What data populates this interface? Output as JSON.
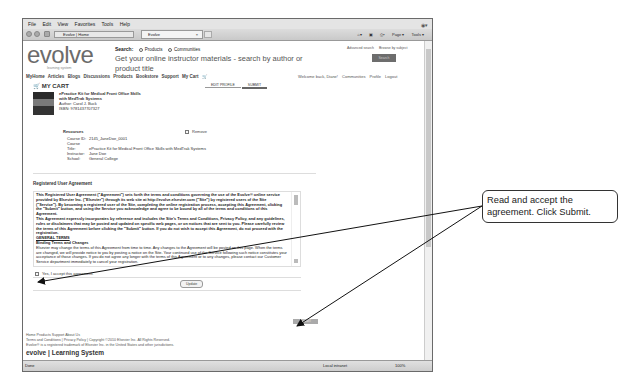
{
  "browser": {
    "menu": [
      "File",
      "Edit",
      "View",
      "Favorites",
      "Tools",
      "Help"
    ],
    "address": "Evolve | Home",
    "tab_title": "Evolve",
    "tab_close": "×",
    "commands": [
      "Page ▾",
      "Tools ▾"
    ],
    "status_left": "Done",
    "status_zone": "Local intranet",
    "status_zoom": "100%"
  },
  "site": {
    "logo": "evolve",
    "logo_sub": "learning system",
    "search_label": "Search:",
    "radio_products": "Products",
    "radio_communities": "Communities",
    "search_placeholder": "Get your online instructor materials - search by author or product title",
    "advanced_search": "Advanced search",
    "browse_by_subject": "Browse by subject",
    "go_button": "Search",
    "nav": [
      "MyHome",
      "Articles",
      "Blogs",
      "Discussions",
      "Products",
      "Bookstore",
      "Support",
      "My Cart"
    ],
    "welcome": "Welcome back, Diane!",
    "user_links": [
      "Communities",
      "Profile",
      "Logout"
    ]
  },
  "cart": {
    "title": "MY CART",
    "tabs": [
      "EDIT PROFILE",
      "SUBMIT"
    ],
    "product": {
      "title_line1": "ePractice Kit for Medical Front Office Skills",
      "title_line2": "with MedTrak Systems",
      "author": "Author: Carol J. Buck",
      "isbn": "ISBN: 9781437707327"
    },
    "resources_label": "Resources",
    "remove_label": "Remove",
    "resources": [
      {
        "k": "Course ID:",
        "v": "2145_JaneDoe_0001"
      },
      {
        "k": "Course Title:",
        "v": "ePractice Kit for Medical Front Office Skills with MedTrak Systems"
      },
      {
        "k": "Instructor:",
        "v": "Jane Doe"
      },
      {
        "k": "School:",
        "v": "General College"
      }
    ]
  },
  "agreement": {
    "title": "Registered User Agreement",
    "p1": "This Registered User Agreement (\"Agreement\") sets forth the terms and conditions governing the use of the Evolve® online service provided by Elsevier Inc. (\"Elsevier\") through its web site at http://evolve.elsevier.com (\"Site\") by registered users of the Site (\"Service\"). By becoming a registered user of the Site, completing the online registration process, accepting this Agreement, clicking the \"Submit\" button, and using the Service you acknowledge and agree to be bound by all of the terms and conditions of this Agreement.",
    "p2": "This Agreement expressly incorporates by reference and includes the Site's Terms and Conditions, Privacy Policy, and any guidelines, rules or disclaimers that may be posted and updated on specific web pages, or on notices that are sent to you. Please carefully review the terms of this Agreement before clicking the \"Submit\" button. If you do not wish to accept this Agreement, do not proceed with the registration.",
    "general": "GENERAL TERMS",
    "binding": "Binding Terms and Changes",
    "p3": "Elsevier may change the terms of this Agreement from time to time. Any changes to the Agreement will be posted on this page. When the terms are changed, we will provide notice to you by posting a notice on the Site. Your continued use of the Service following such notice constitutes your acceptance of those changes. If you do not agree any longer with the terms of this Agreement or to any changes, please contact our Customer Service department immediately to cancel your registration.",
    "accept_label": "Yes, I accept this agreement.",
    "update_button": "Update",
    "submit_button": "SUBMIT"
  },
  "footer": {
    "links": "Home  Products  Support  About Us",
    "legal": "Terms and Conditions | Privacy Policy | Copyright ©2010 Elsevier Inc. All Rights Reserved.",
    "trademark": "Evolve® is a registered trademark of Elsevier Inc. in the United States and other jurisdictions.",
    "brand": "evolve | Learning System"
  },
  "callout": {
    "text": "Read and accept the agreement. Click Submit."
  }
}
